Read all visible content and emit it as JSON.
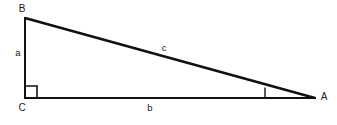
{
  "figure": {
    "type": "right-triangle-diagram",
    "background_color": "#ffffff",
    "stroke_color": "#111111",
    "vertices": [
      {
        "id": "B",
        "label": "B",
        "x": 25,
        "y": 18,
        "label_x": 22,
        "label_y": 8
      },
      {
        "id": "C",
        "label": "C",
        "x": 25,
        "y": 98,
        "label_x": 22,
        "label_y": 108
      },
      {
        "id": "A",
        "label": "A",
        "x": 315,
        "y": 98,
        "label_x": 324,
        "label_y": 97
      }
    ],
    "sides": [
      {
        "id": "a",
        "label": "a",
        "from": "B",
        "to": "C",
        "label_x": 18,
        "label_y": 53,
        "x1": 25,
        "y1": 18,
        "x2": 25,
        "y2": 98,
        "stroke_width": 2
      },
      {
        "id": "b",
        "label": "b",
        "from": "C",
        "to": "A",
        "label_x": 150,
        "label_y": 108,
        "x1": 25,
        "y1": 98,
        "x2": 315,
        "y2": 98,
        "stroke_width": 2
      },
      {
        "id": "c",
        "label": "c",
        "from": "B",
        "to": "A",
        "label_x": 164,
        "label_y": 48,
        "x1": 25,
        "y1": 18,
        "x2": 315,
        "y2": 98,
        "stroke_width": 2.6
      }
    ],
    "angle_markers": [
      {
        "id": "right-angle-C",
        "at_vertex": "C",
        "kind": "square",
        "x": 25,
        "y": 86,
        "size": 12,
        "stroke_width": 1.6
      },
      {
        "id": "angle-A",
        "at_vertex": "A",
        "kind": "tick",
        "x1": 265,
        "y1": 87.5,
        "x2": 265,
        "y2": 98,
        "stroke_width": 1.4
      }
    ]
  }
}
